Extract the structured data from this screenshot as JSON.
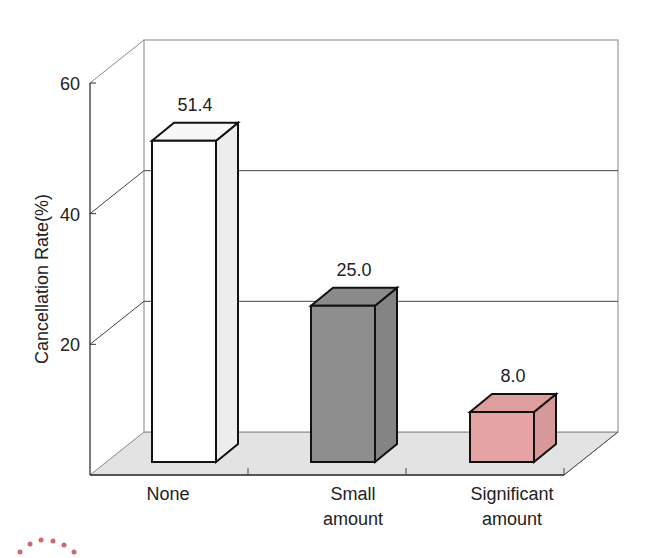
{
  "chart_data": {
    "type": "bar",
    "style": "3d",
    "title": "",
    "xlabel": "",
    "ylabel": "Cancellation Rate(%)",
    "ylim": [
      0,
      60
    ],
    "yticks": [
      "20",
      "40",
      "60"
    ],
    "grid": true,
    "categories": [
      "None",
      "Small amount",
      "Significant amount"
    ],
    "category_lines": [
      [
        "None"
      ],
      [
        "Small",
        "amount"
      ],
      [
        "Significant",
        "amount"
      ]
    ],
    "values": [
      51.4,
      25.0,
      8.0
    ],
    "value_labels": [
      "51.4",
      "25.0",
      "8.0"
    ],
    "colors": [
      "#ffffff",
      "#8e8e8e",
      "#e6a3a3"
    ],
    "legend": null
  },
  "decor": {
    "dots_color": "#d06a6a"
  }
}
